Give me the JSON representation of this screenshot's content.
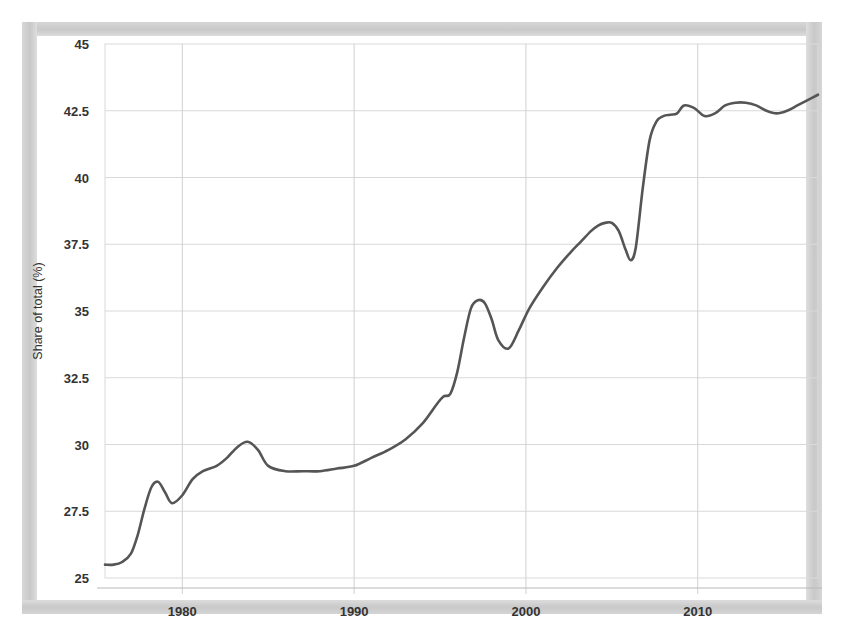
{
  "chart_data": {
    "type": "line",
    "title": "",
    "subtitle": "",
    "xlabel": "",
    "ylabel": "Share of total (%)",
    "xlim": [
      1975.5,
      2017.0
    ],
    "ylim": [
      25,
      45
    ],
    "grid": true,
    "legend": null,
    "legend_position": "none",
    "xticks": [
      1980,
      1990,
      2000,
      2010
    ],
    "xtick_labels": [
      "1980",
      "1990",
      "2000",
      "2010"
    ],
    "yticks": [
      25,
      27.5,
      30,
      32.5,
      35,
      37.5,
      40,
      42.5,
      45
    ],
    "ytick_labels": [
      "25",
      "27.5",
      "30",
      "32.5",
      "35",
      "37.5",
      "40",
      "42.5",
      "45"
    ],
    "line_color": "#555555",
    "series": [
      {
        "name": "Share of total",
        "x": [
          1975.5,
          1976,
          1976.5,
          1977,
          1977.4,
          1977.8,
          1978.2,
          1978.6,
          1979,
          1979.4,
          1980,
          1980.6,
          1981.2,
          1982,
          1982.6,
          1983.2,
          1983.8,
          1984.4,
          1985,
          1986,
          1987,
          1988,
          1989,
          1990,
          1991,
          1992,
          1993,
          1994,
          1994.8,
          1995.2,
          1995.6,
          1996,
          1996.4,
          1996.8,
          1997.2,
          1997.6,
          1998,
          1998.4,
          1999,
          1999.6,
          2000.2,
          2001,
          2001.8,
          2002.6,
          2003.2,
          2003.8,
          2004.2,
          2004.6,
          2005,
          2005.4,
          2005.8,
          2006.1,
          2006.4,
          2006.8,
          2007.2,
          2007.6,
          2008,
          2008.4,
          2008.8,
          2009.2,
          2009.8,
          2010.4,
          2011,
          2011.6,
          2012.2,
          2012.8,
          2013.4,
          2014,
          2014.6,
          2015.2,
          2015.8,
          2016.4,
          2017
        ],
        "values": [
          25.5,
          25.5,
          25.6,
          25.9,
          26.6,
          27.6,
          28.4,
          28.6,
          28.2,
          27.8,
          28.1,
          28.7,
          29.0,
          29.2,
          29.5,
          29.9,
          30.1,
          29.8,
          29.2,
          29.0,
          29.0,
          29.0,
          29.1,
          29.2,
          29.5,
          29.8,
          30.2,
          30.8,
          31.5,
          31.8,
          31.9,
          32.7,
          34.0,
          35.1,
          35.4,
          35.3,
          34.7,
          33.9,
          33.6,
          34.3,
          35.1,
          35.9,
          36.6,
          37.2,
          37.6,
          38.0,
          38.2,
          38.3,
          38.3,
          38.0,
          37.3,
          36.9,
          37.4,
          39.6,
          41.4,
          42.1,
          42.3,
          42.35,
          42.4,
          42.7,
          42.6,
          42.3,
          42.4,
          42.7,
          42.8,
          42.8,
          42.7,
          42.5,
          42.4,
          42.5,
          42.7,
          42.9,
          43.1
        ],
        "color": "#555555",
        "style": "solid"
      }
    ],
    "annotations": []
  },
  "axis": {
    "y_title": "Share of total (%)"
  }
}
